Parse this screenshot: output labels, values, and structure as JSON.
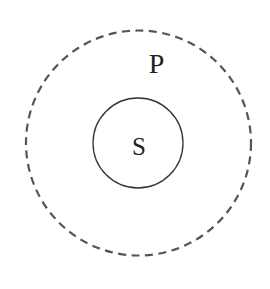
{
  "diagram": {
    "type": "nested-sets",
    "background": "#ffffff",
    "outer_set": {
      "label": "P",
      "style": "dashed",
      "stroke_color": "#555555",
      "center": [
        138.5,
        143
      ],
      "radius": 112.5
    },
    "inner_set": {
      "label": "S",
      "style": "solid",
      "stroke_color": "#333333",
      "center": [
        138,
        143
      ],
      "radius": 45
    },
    "relation": "S is a subset of P"
  }
}
